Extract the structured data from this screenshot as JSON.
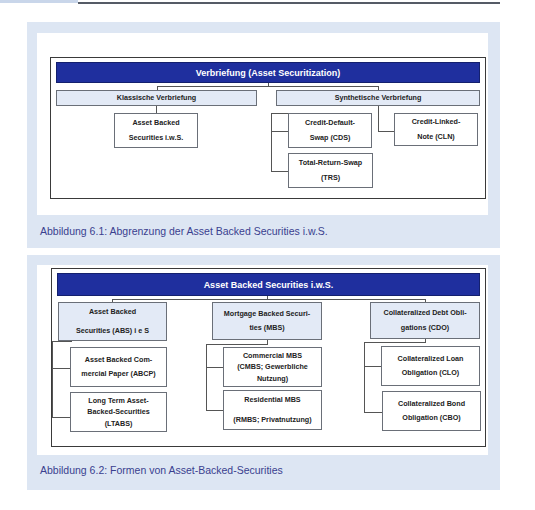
{
  "figure1": {
    "header": "Verbriefung (Asset Securitization)",
    "categories": [
      {
        "label": "Klassische Verbriefung"
      },
      {
        "label": "Synthetische Verbriefung"
      }
    ],
    "boxes": {
      "abs_iws": "Asset Backed\nSecurities i.w.S.",
      "cds": "Credit-Default-\nSwap (CDS)",
      "cln": "Credit-Linked-\nNote (CLN)",
      "trs": "Total-Return-Swap\n(TRS)"
    },
    "caption": "Abbildung 6.1:  Abgrenzung der Asset Backed Securities i.w.S."
  },
  "figure2": {
    "header": "Asset Backed Securities i.w.S.",
    "categories": [
      {
        "label": "Asset Backed\n\nSecurities (ABS) i e S"
      },
      {
        "label": "Mortgage Backed Securi-\nties (MBS)"
      },
      {
        "label": "Collateralized Debt Obli-\ngations (CDO)"
      }
    ],
    "boxes": {
      "abcp": "Asset Backed Com-\nmercial Paper (ABCP)",
      "ltabs": "Long Term Asset-\nBacked-Securities\n(LTABS)",
      "cmbs": "Commercial MBS\n(CMBS; Gewerbliche\nNutzung)",
      "rmbs": "Residential MBS\n\n(RMBS; Privatnutzung)",
      "clo": "Collateralized Loan\nObligation (CLO)",
      "cbo": "Collateralized Bond\nObligation (CBO)"
    },
    "caption": "Abbildung 6.2:  Formen von Asset-Backed-Securities"
  }
}
